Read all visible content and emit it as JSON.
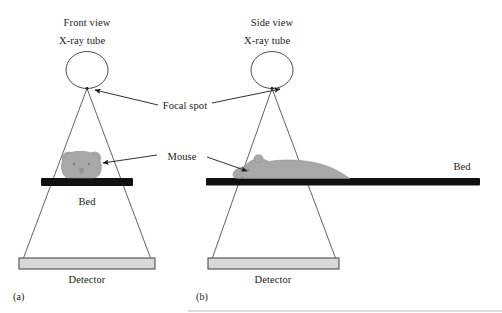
{
  "figure": {
    "title_a": "Front view",
    "title_b": "Side view",
    "tube_label_a": "X-ray tube",
    "tube_label_b": "X-ray tube",
    "focal_spot_label": "Focal spot",
    "mouse_label": "Mouse",
    "bed_label_a": "Bed",
    "bed_label_b": "Bed",
    "detector_label_a": "Detector",
    "detector_label_b": "Detector",
    "panel_a": "(a)",
    "panel_b": "(b)",
    "colors": {
      "background": "#ffffff",
      "line": "#3a3a3a",
      "text": "#1a1a1a",
      "bed": "#111111",
      "detector_fill": "#d9d9d9",
      "mouse_fill": "#a8a8a8"
    },
    "icons": {
      "tube": "circle-xray-tube-icon",
      "focal_spot": "focal-spot-icon",
      "beam": "x-ray-beam-cone-icon",
      "mouse_front": "mouse-front-icon",
      "mouse_side": "mouse-side-icon",
      "detector": "detector-array-icon",
      "bed": "bed-bar-icon",
      "arrow": "arrow-pointer-icon"
    }
  }
}
